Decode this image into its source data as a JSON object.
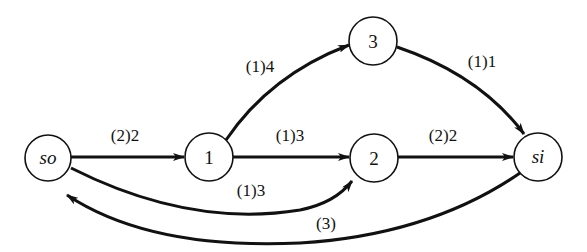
{
  "diagram": {
    "type": "flow-network",
    "nodes": [
      {
        "id": "so",
        "label": "so",
        "italic": true,
        "x": 48,
        "y": 158
      },
      {
        "id": "1",
        "label": "1",
        "italic": false,
        "x": 209,
        "y": 157
      },
      {
        "id": "3",
        "label": "3",
        "italic": false,
        "x": 373,
        "y": 41
      },
      {
        "id": "2",
        "label": "2",
        "italic": false,
        "x": 374,
        "y": 158
      },
      {
        "id": "si",
        "label": "si",
        "italic": true,
        "x": 538,
        "y": 157
      }
    ],
    "edges": [
      {
        "from": "so",
        "to": "1",
        "label": "(2)2"
      },
      {
        "from": "1",
        "to": "3",
        "label": "(1)4"
      },
      {
        "from": "1",
        "to": "2",
        "label": "(1)3"
      },
      {
        "from": "3",
        "to": "si",
        "label": "(1)1"
      },
      {
        "from": "2",
        "to": "si",
        "label": "(2)2"
      },
      {
        "from": "so",
        "to": "2",
        "label": "(1)3"
      },
      {
        "from": "si",
        "to": "so",
        "label": "(3)"
      }
    ]
  }
}
